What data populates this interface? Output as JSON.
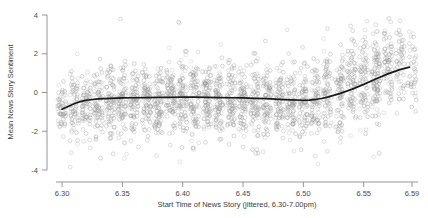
{
  "chart_data": {
    "type": "scatter",
    "title": "",
    "xlabel": "Start Time of News Story (jittered, 6.30-7.00pm)",
    "ylabel": "Mean News Story Sentiment",
    "xlim": [
      6.295,
      6.595
    ],
    "ylim": [
      -4,
      4
    ],
    "grid": false,
    "legend": null,
    "xticks": [
      6.3,
      6.35,
      6.4,
      6.45,
      6.5,
      6.55,
      6.59
    ],
    "xtick_labels": [
      "6.30",
      "6.35",
      "6.40",
      "6.45",
      "6.50",
      "6.55",
      "6.59"
    ],
    "yticks": [
      4,
      2,
      0,
      -2,
      -4
    ],
    "ytick_labels": [
      "4",
      "2",
      "0",
      "-2",
      "-4"
    ],
    "marker": {
      "shape": "open-circle",
      "radius_px": 1.9,
      "color": "#9a9a9a",
      "fill": "none"
    },
    "point_count": 2100,
    "jitter_clusters_per_minute": true,
    "series": [
      {
        "name": "News story sentiment observations",
        "type": "scatter",
        "description": "Jittered vertical clusters of mean sentiment per news story, one cluster per minute from 6.30 to 6.59pm. Bulk of mass between -2 and +1, widening and shifting upward after 6.50.",
        "cluster_centers_x": [
          6.3,
          6.31,
          6.32,
          6.33,
          6.34,
          6.35,
          6.36,
          6.37,
          6.38,
          6.39,
          6.4,
          6.41,
          6.42,
          6.43,
          6.44,
          6.45,
          6.46,
          6.47,
          6.48,
          6.49,
          6.5,
          6.51,
          6.52,
          6.53,
          6.54,
          6.55,
          6.56,
          6.57,
          6.58,
          6.59
        ],
        "cluster_mean_y": [
          -0.85,
          -0.7,
          -0.55,
          -0.48,
          -0.42,
          -0.4,
          -0.38,
          -0.36,
          -0.34,
          -0.33,
          -0.32,
          -0.33,
          -0.34,
          -0.35,
          -0.36,
          -0.38,
          -0.4,
          -0.42,
          -0.45,
          -0.48,
          -0.5,
          -0.4,
          -0.2,
          0.1,
          0.45,
          0.8,
          1.05,
          1.2,
          1.28,
          1.32
        ],
        "cluster_sd_y": [
          0.72,
          0.8,
          0.85,
          0.88,
          0.9,
          0.92,
          0.92,
          0.93,
          0.93,
          0.94,
          0.94,
          0.94,
          0.94,
          0.93,
          0.93,
          0.92,
          0.92,
          0.92,
          0.93,
          0.95,
          0.98,
          1.02,
          1.06,
          1.1,
          1.14,
          1.18,
          1.2,
          1.12,
          1.0,
          0.9
        ],
        "cluster_n": [
          55,
          62,
          70,
          74,
          76,
          78,
          80,
          80,
          82,
          82,
          84,
          84,
          84,
          82,
          82,
          80,
          80,
          78,
          78,
          76,
          76,
          74,
          72,
          72,
          74,
          78,
          96,
          70,
          52,
          40
        ]
      },
      {
        "name": "LOESS smoothed trend",
        "type": "line",
        "color": "#1a1a1a",
        "x": [
          6.3,
          6.305,
          6.31,
          6.315,
          6.32,
          6.33,
          6.34,
          6.35,
          6.36,
          6.37,
          6.38,
          6.39,
          6.4,
          6.41,
          6.42,
          6.43,
          6.44,
          6.45,
          6.46,
          6.47,
          6.48,
          6.49,
          6.5,
          6.505,
          6.51,
          6.515,
          6.52,
          6.53,
          6.54,
          6.55,
          6.56,
          6.57,
          6.58,
          6.588
        ],
        "y": [
          -0.86,
          -0.72,
          -0.58,
          -0.47,
          -0.4,
          -0.33,
          -0.3,
          -0.28,
          -0.27,
          -0.26,
          -0.25,
          -0.25,
          -0.24,
          -0.24,
          -0.25,
          -0.26,
          -0.27,
          -0.28,
          -0.3,
          -0.32,
          -0.35,
          -0.38,
          -0.4,
          -0.39,
          -0.36,
          -0.31,
          -0.24,
          -0.06,
          0.16,
          0.42,
          0.7,
          0.96,
          1.18,
          1.31
        ]
      }
    ],
    "annotations": []
  },
  "axes": {
    "y_title": "Mean News Story Sentiment",
    "x_title": "Start Time of News Story (jittered, 6.30-7.00pm)"
  }
}
